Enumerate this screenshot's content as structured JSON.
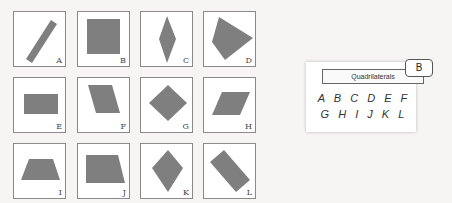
{
  "shape_color": "#7f7f7f",
  "cards": [
    {
      "label": "A",
      "shape": "rotated-rectangle"
    },
    {
      "label": "B",
      "shape": "square"
    },
    {
      "label": "C",
      "shape": "thin-rhombus"
    },
    {
      "label": "D",
      "shape": "irregular-quadrilateral"
    },
    {
      "label": "E",
      "shape": "rectangle"
    },
    {
      "label": "F",
      "shape": "parallelogram-vertical"
    },
    {
      "label": "G",
      "shape": "rotated-square"
    },
    {
      "label": "H",
      "shape": "parallelogram"
    },
    {
      "label": "I",
      "shape": "trapezoid"
    },
    {
      "label": "J",
      "shape": "trapezoid-right"
    },
    {
      "label": "K",
      "shape": "kite"
    },
    {
      "label": "L",
      "shape": "rotated-rectangle"
    }
  ],
  "answer_panel": {
    "title": "Quadrilaterals",
    "badge": "B",
    "row1": "ABCDEF",
    "row2": "GHIJKL"
  }
}
